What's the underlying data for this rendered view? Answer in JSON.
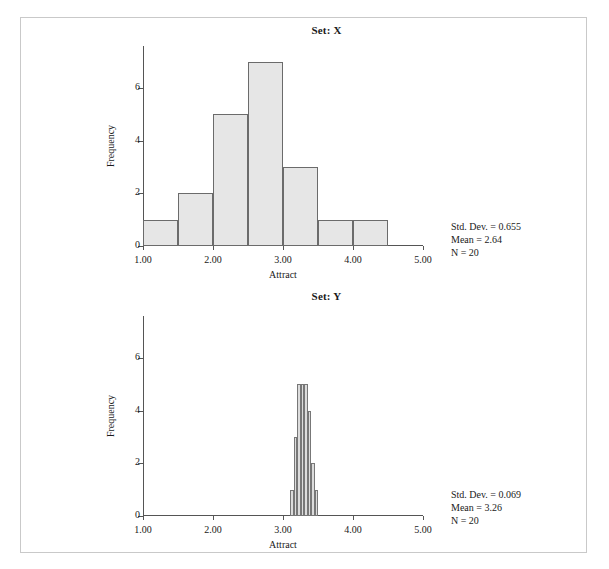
{
  "page": {
    "background": "#ffffff",
    "frame_color": "#c9c9c9"
  },
  "charts": [
    {
      "title": "Set: X",
      "stats": {
        "std_dev": "Std. Dev. = 0.655",
        "mean": "Mean = 2.64",
        "n": "N = 20"
      }
    },
    {
      "title": "Set: Y",
      "stats": {
        "std_dev": "Std. Dev. = 0.069",
        "mean": "Mean = 3.26",
        "n": "N = 20"
      }
    }
  ],
  "chart_data": [
    {
      "type": "bar",
      "title": "Set: X",
      "xlabel": "Attract",
      "ylabel": "Frequency",
      "xlim": [
        1.0,
        5.0
      ],
      "ylim": [
        0,
        7.6
      ],
      "xticks": [
        1.0,
        2.0,
        3.0,
        4.0,
        5.0
      ],
      "xtick_labels": [
        "1.00",
        "2.00",
        "3.00",
        "4.00",
        "5.00"
      ],
      "yticks": [
        0,
        2,
        4,
        6
      ],
      "ytick_labels": [
        "0",
        "2",
        "4",
        "6"
      ],
      "grid": false,
      "bin_width": 0.5,
      "bin_starts": [
        1.0,
        1.5,
        2.0,
        2.5,
        3.0,
        3.5,
        4.0
      ],
      "values": [
        1,
        2,
        5,
        7,
        3,
        1,
        1
      ],
      "bar_fill": "#e6e6e6",
      "bar_edge": "#6b6b6b",
      "annotations": [
        "Std. Dev. = 0.655",
        "Mean = 2.64",
        "N = 20"
      ]
    },
    {
      "type": "bar",
      "title": "Set: Y",
      "xlabel": "Attract",
      "ylabel": "Frequency",
      "xlim": [
        1.0,
        5.0
      ],
      "ylim": [
        0,
        7.6
      ],
      "xticks": [
        1.0,
        2.0,
        3.0,
        4.0,
        5.0
      ],
      "xtick_labels": [
        "1.00",
        "2.00",
        "3.00",
        "4.00",
        "5.00"
      ],
      "yticks": [
        0,
        2,
        4,
        6
      ],
      "ytick_labels": [
        "0",
        "2",
        "4",
        "6"
      ],
      "grid": false,
      "bin_width": 0.05,
      "bin_starts": [
        3.1,
        3.15,
        3.2,
        3.25,
        3.3,
        3.35,
        3.4,
        3.45
      ],
      "values": [
        1,
        3,
        5,
        5,
        5,
        4,
        2,
        1
      ],
      "bar_fill": "#dcdcdc",
      "bar_edge": "#777777",
      "annotations": [
        "Std. Dev. = 0.069",
        "Mean = 3.26",
        "N = 20"
      ]
    }
  ]
}
